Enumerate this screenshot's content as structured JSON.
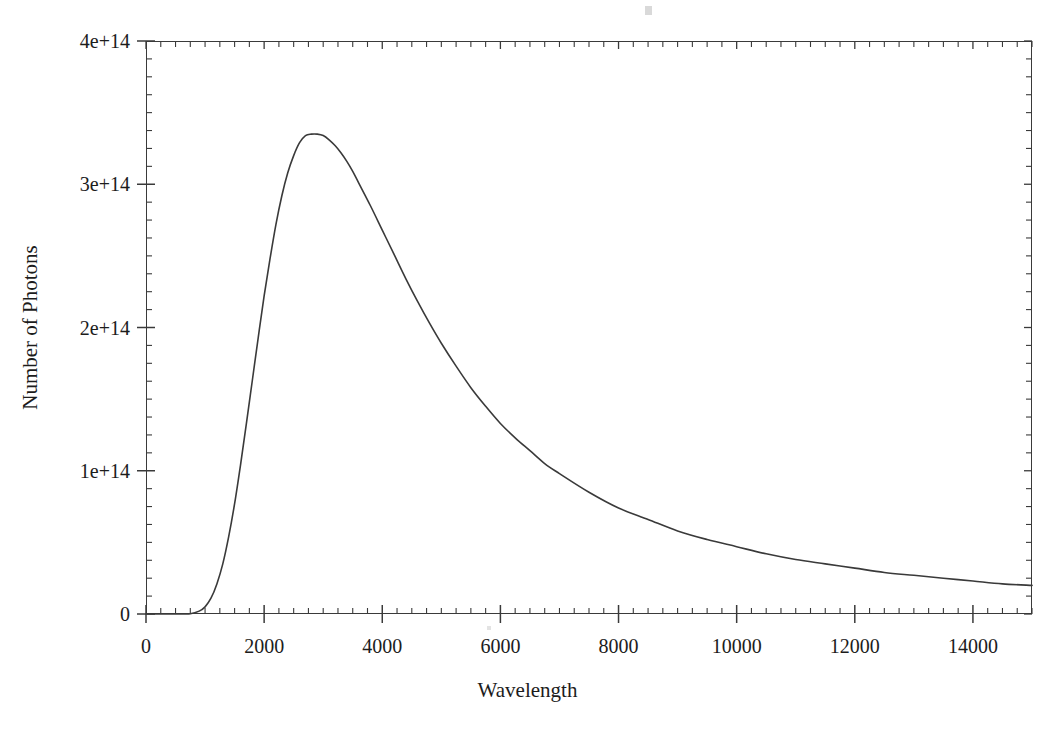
{
  "chart_data": {
    "type": "line",
    "title": "",
    "subtitle": "",
    "xlabel": "Wavelength",
    "ylabel": "Number of Photons",
    "xlim": [
      0,
      15000
    ],
    "ylim": [
      0,
      400000000000000
    ],
    "grid": false,
    "legend": null,
    "legend_position": "none",
    "x_tick_labels": [
      "0",
      "2000",
      "4000",
      "6000",
      "8000",
      "10000",
      "12000",
      "14000"
    ],
    "x_tick_values": [
      0,
      2000,
      4000,
      6000,
      8000,
      10000,
      12000,
      14000
    ],
    "x_minor_tick_interval": 250,
    "y_tick_labels": [
      "0",
      "1e+14",
      "2e+14",
      "3e+14",
      "4e+14"
    ],
    "y_tick_values": [
      0,
      100000000000000,
      200000000000000,
      300000000000000,
      400000000000000
    ],
    "y_minor_tick_interval": 12500000000000,
    "line_color": "#3a3a3a",
    "line_width": 1.6,
    "series": [
      {
        "name": "Number of Photons",
        "x": [
          0,
          250,
          500,
          750,
          900,
          1000,
          1100,
          1200,
          1300,
          1400,
          1500,
          1600,
          1700,
          1800,
          1900,
          2000,
          2100,
          2200,
          2300,
          2400,
          2500,
          2600,
          2700,
          2800,
          2900,
          3000,
          3100,
          3200,
          3300,
          3400,
          3500,
          3600,
          3800,
          4000,
          4200,
          4400,
          4600,
          4800,
          5000,
          5250,
          5500,
          5750,
          6000,
          6250,
          6500,
          6750,
          7000,
          7500,
          8000,
          8500,
          9000,
          9500,
          10000,
          10500,
          11000,
          11500,
          12000,
          12500,
          13000,
          13500,
          14000,
          14500,
          15000
        ],
        "y": [
          0,
          0,
          0,
          200000000000,
          2000000000000,
          5000000000000,
          11000000000000,
          21000000000000,
          35000000000000,
          54000000000000,
          77000000000000,
          104000000000000,
          133000000000000,
          163000000000000,
          193000000000000,
          222000000000000,
          248000000000000,
          272000000000000,
          292000000000000,
          308000000000000,
          320000000000000,
          329000000000000,
          334000000000000,
          335000000000000,
          335000000000000,
          334000000000000,
          331000000000000,
          327000000000000,
          322000000000000,
          316000000000000,
          309000000000000,
          301000000000000,
          285000000000000,
          268000000000000,
          251000000000000,
          234000000000000,
          218000000000000,
          203000000000000,
          189000000000000,
          173000000000000,
          158000000000000,
          145000000000000,
          133000000000000,
          123000000000000,
          114000000000000,
          105000000000000,
          98000000000000,
          85000000000000,
          74000000000000,
          66000000000000,
          58000000000000,
          52000000000000,
          47000000000000,
          42000000000000,
          38000000000000,
          35000000000000,
          32000000000000,
          29000000000000,
          27000000000000,
          25000000000000,
          23000000000000,
          21000000000000,
          20000000000000
        ],
        "peak_x": 2850,
        "peak_y": 335000000000000
      }
    ],
    "annotations": []
  },
  "axes": {
    "x_title": "Wavelength",
    "y_title": "Number of Photons"
  }
}
